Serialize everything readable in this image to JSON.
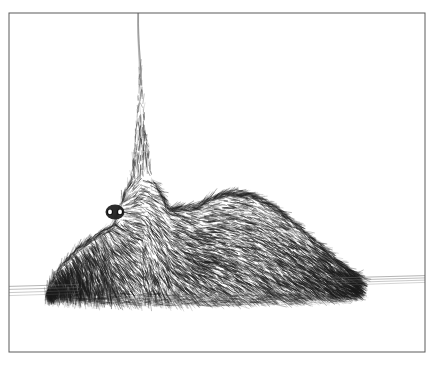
{
  "artwork": {
    "title": "Furry Creature With Spike",
    "medium": "pen-and-ink crosshatch drawing",
    "background_color": "#ffffff",
    "ink_color": "#1a1a1a",
    "frame": {
      "stroke_color": "#5a5a5a",
      "x": 9,
      "y": 13,
      "width": 416,
      "height": 339
    },
    "horizon": {
      "stroke_color": "#6b6b6b",
      "left_x": 9,
      "left_y": 291,
      "right_x": 425,
      "right_y": 279,
      "line_count": 4
    },
    "antenna": {
      "stroke_color": "#7d7d7d",
      "top_x": 138,
      "top_y": 13,
      "base_x": 140,
      "base_y": 85
    },
    "creature": {
      "body_left_x": 45,
      "body_right_x": 358,
      "body_base_y": 300,
      "crest_peak_x": 140,
      "crest_peak_y": 70,
      "hump_peak_x": 235,
      "hump_peak_y": 192,
      "fur_stroke_count": 9000
    },
    "eyes": {
      "left": {
        "cx": 110,
        "cy": 212,
        "r": 3.1
      },
      "right": {
        "cx": 120,
        "cy": 212,
        "r": 3.1
      },
      "socket": {
        "cx": 115,
        "cy": 212,
        "rx": 9.5,
        "ry": 7.5
      },
      "pupil_color": "#111111",
      "shine_color": "#ffffff"
    }
  }
}
